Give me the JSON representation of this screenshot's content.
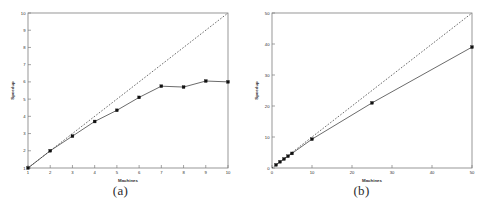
{
  "figure": {
    "panels": [
      {
        "caption": "(a)",
        "xlabel": "Machines",
        "ylabel": "Speedup"
      },
      {
        "caption": "(b)",
        "xlabel": "Machines",
        "ylabel": "Speedup"
      }
    ]
  },
  "chart_data": [
    {
      "type": "line",
      "title": "",
      "subtitle": "",
      "caption": "(a)",
      "xlabel": "Machines",
      "ylabel": "Speedup",
      "xlim": [
        1,
        10
      ],
      "ylim": [
        1,
        10
      ],
      "xticks": [
        1,
        2,
        3,
        4,
        5,
        6,
        7,
        8,
        9,
        10
      ],
      "yticks": [
        1,
        2,
        3,
        4,
        5,
        6,
        7,
        8,
        9,
        10
      ],
      "xticklabels": [
        "1",
        "2",
        "3",
        "4",
        "5",
        "6",
        "7",
        "8",
        "9",
        "10"
      ],
      "yticklabels": [
        "1",
        "2",
        "3",
        "4",
        "5",
        "6",
        "7",
        "8",
        "9",
        "10"
      ],
      "grid": false,
      "legend": "none",
      "series": [
        {
          "name": "ideal",
          "style": "dashed",
          "marker": "none",
          "x": [
            1,
            10
          ],
          "values": [
            1,
            10
          ]
        },
        {
          "name": "measured",
          "style": "solid",
          "marker": "square",
          "x": [
            1,
            2,
            3,
            4,
            5,
            6,
            7,
            8,
            9,
            10
          ],
          "values": [
            1.0,
            2.0,
            2.85,
            3.7,
            4.35,
            5.1,
            5.75,
            5.7,
            6.05,
            6.0
          ]
        }
      ]
    },
    {
      "type": "line",
      "title": "",
      "subtitle": "",
      "caption": "(b)",
      "xlabel": "Machines",
      "ylabel": "Speedup",
      "xlim": [
        0,
        50
      ],
      "ylim": [
        0,
        50
      ],
      "xticks": [
        0,
        10,
        20,
        30,
        40,
        50
      ],
      "yticks": [
        0,
        10,
        20,
        30,
        40,
        50
      ],
      "xticklabels": [
        "0",
        "10",
        "20",
        "30",
        "40",
        "50"
      ],
      "yticklabels": [
        "0",
        "10",
        "20",
        "30",
        "40",
        "50"
      ],
      "grid": false,
      "legend": "none",
      "series": [
        {
          "name": "ideal",
          "style": "dashed",
          "marker": "none",
          "x": [
            0,
            50
          ],
          "values": [
            0,
            50
          ]
        },
        {
          "name": "measured",
          "style": "solid",
          "marker": "square",
          "x": [
            1,
            2,
            3,
            4,
            5,
            10,
            25,
            50
          ],
          "values": [
            1.0,
            2.0,
            2.9,
            3.8,
            4.7,
            9.3,
            21.0,
            39.0
          ]
        }
      ]
    }
  ]
}
